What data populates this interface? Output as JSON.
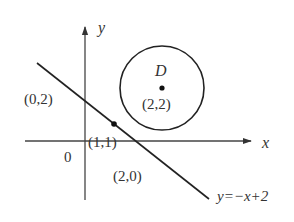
{
  "diagram": {
    "type": "coordinate-geometry",
    "axes": {
      "x_label": "x",
      "y_label": "y",
      "origin_label": "0"
    },
    "circle": {
      "label": "D",
      "center_label": "(2,2)",
      "center": [
        2,
        2
      ]
    },
    "line": {
      "label": "y=−x+2",
      "equation": "y=-x+2"
    },
    "points": {
      "tangent_point": "(1,1)",
      "y_intercept": "(0,2)",
      "x_intercept": "(2,0)"
    },
    "colors": {
      "stroke": "#333333",
      "background": "#ffffff"
    }
  }
}
